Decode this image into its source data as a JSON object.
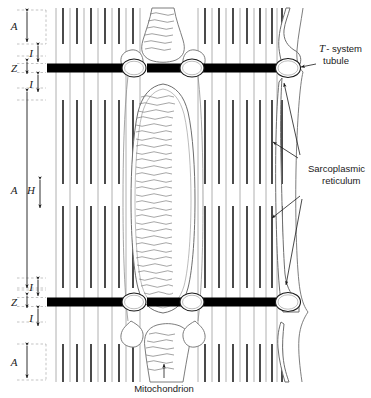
{
  "figure": {
    "background_color": "#ffffff",
    "ink_color": "#1a1a1a",
    "thin_filament_color": "#8a8a8a",
    "thick_filament_color": "#2b2b2b",
    "z_line_color": "#000000",
    "membrane_color": "#6e6e6e",
    "guide_color": "#9a9a9a",
    "width": 371,
    "height": 398
  },
  "band_labels": {
    "a_top": "A",
    "i_top_upper": "I",
    "z_top": "Z",
    "i_top_lower": "I",
    "a_middle": "A",
    "h_middle": "H",
    "i_bottom_upper": "I",
    "z_bottom": "Z",
    "i_bottom_lower": "I",
    "a_bottom": "A"
  },
  "annotations": {
    "t_system": {
      "line1": "T",
      "line1_rest": "- system",
      "line2": "tubule"
    },
    "sarcoplasmic_reticulum": {
      "line1": "Sarcoplasmic",
      "line2": "reticulum"
    },
    "mitochondrion": {
      "label": "Mitochondrion"
    }
  },
  "structures": {
    "z_lines": 2,
    "t_tubules_per_z_line": 4,
    "mitochondria": 3,
    "sarcoplasmic_reticulum_arrows": 4,
    "thick_filaments_left": 7,
    "thick_filaments_right": 7
  }
}
